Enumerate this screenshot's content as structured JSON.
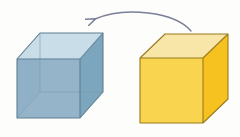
{
  "figure": {
    "background_color": "#fdfdfb",
    "width": 240,
    "height": 137,
    "caption": "A yellow opaque cube on the right and a translucent blue cube on the left, joined by a curved arrow pointing from the yellow cube to the blue cube."
  },
  "blue_cube": {
    "label": "translucent blue cube",
    "style": "transparent with visible hidden back edges",
    "colors": {
      "top_face": "#c9dde8",
      "left_face": "#8fb0c6",
      "right_face": "#7ba6bd",
      "hidden_overlap": "#9dbcce",
      "edge_stroke": "#5f7f92",
      "hidden_edge_stroke": "#7d9aad"
    },
    "vertices": {
      "front_top_left": "17,59",
      "front_top_right": "80,59",
      "front_bottom_left": "17,118",
      "front_bottom_right": "80,118",
      "back_top_left": "40,33",
      "back_top_right": "103,33",
      "back_bottom_left": "40,92",
      "back_bottom_right": "103,92"
    }
  },
  "yellow_cube": {
    "label": "opaque yellow cube",
    "style": "solid, only front, top and right faces visible",
    "colors": {
      "top_face": "#f7e6a8",
      "front_face": "#f9d54f",
      "right_face": "#f5c220",
      "edge_stroke": "#9a7a1d"
    },
    "vertices": {
      "front_top_left": "140,58",
      "front_top_right": "203,58",
      "front_bottom_left": "140,123",
      "front_bottom_right": "203,123",
      "back_top_right": "228,34",
      "back_bottom_right": "228,99"
    }
  },
  "arrow": {
    "label": "curved rotation arrow",
    "direction": "right to left",
    "color": "#7a7f96",
    "stroke_width": 1.4,
    "tail_point": "191,31",
    "tip_point": "87,23",
    "head_size": 11
  }
}
